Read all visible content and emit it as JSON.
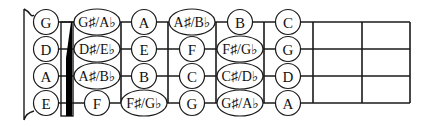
{
  "diagram": {
    "type": "fretboard",
    "strings": [
      "G",
      "D",
      "A",
      "E"
    ],
    "string_y": [
      22,
      49,
      76,
      103
    ],
    "fret_x": [
      121,
      168,
      216,
      264,
      313,
      362,
      410
    ],
    "nut": {
      "x": 61,
      "width": 12,
      "top": 22,
      "bottom": 116
    },
    "colors": {
      "line": "#1a1a1a",
      "fill": "#ffffff",
      "nut": "#000000"
    },
    "columns": [
      {
        "label": "open",
        "cx": 46
      },
      {
        "label": "fret-1",
        "cx": 97
      },
      {
        "label": "fret-2",
        "cx": 144
      },
      {
        "label": "fret-3",
        "cx": 192
      },
      {
        "label": "fret-4",
        "cx": 240
      },
      {
        "label": "fret-5",
        "cx": 288
      }
    ],
    "notes": [
      [
        "G",
        "G♯/A♭",
        "A",
        "A♯/B♭",
        "B",
        "C"
      ],
      [
        "D",
        "D♯/E♭",
        "E",
        "F",
        "F♯/G♭",
        "G"
      ],
      [
        "A",
        "A♯/B♭",
        "B",
        "C",
        "C♯/D♭",
        "D"
      ],
      [
        "E",
        "F",
        "F♯/G♭",
        "G",
        "G♯/A♭",
        "A"
      ]
    ]
  }
}
